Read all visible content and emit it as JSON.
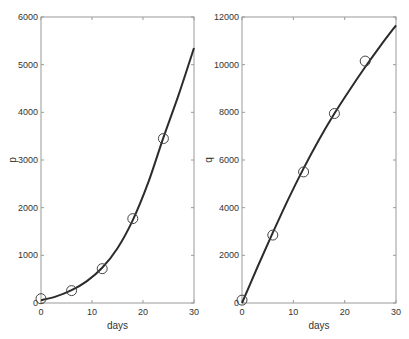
{
  "chart_data": [
    {
      "type": "line",
      "title": "",
      "xlabel": "days",
      "ylabel": "p",
      "xlim": [
        0,
        30
      ],
      "ylim": [
        0,
        6000
      ],
      "xticks": [
        0,
        10,
        20,
        30
      ],
      "yticks": [
        0,
        1000,
        2000,
        3000,
        4000,
        5000,
        6000
      ],
      "grid": false,
      "legend": null,
      "series": [
        {
          "name": "data",
          "style": "markers (open circles)",
          "x": [
            0,
            6,
            12,
            18,
            24
          ],
          "y": [
            90,
            260,
            720,
            1770,
            3450
          ]
        },
        {
          "name": "fit",
          "style": "solid line",
          "x": [
            0,
            3,
            6,
            9,
            12,
            15,
            18,
            21,
            24,
            27,
            30
          ],
          "y": [
            60,
            140,
            270,
            460,
            740,
            1150,
            1740,
            2520,
            3470,
            4370,
            5350
          ]
        }
      ]
    },
    {
      "type": "line",
      "title": "",
      "xlabel": "days",
      "ylabel": "q",
      "xlim": [
        0,
        30
      ],
      "ylim": [
        0,
        12000
      ],
      "xticks": [
        0,
        10,
        20,
        30
      ],
      "yticks": [
        0,
        2000,
        4000,
        6000,
        8000,
        10000,
        12000
      ],
      "grid": false,
      "legend": null,
      "series": [
        {
          "name": "data",
          "style": "markers (open circles)",
          "x": [
            0,
            6,
            12,
            18,
            24
          ],
          "y": [
            120,
            2850,
            5500,
            7950,
            10150
          ]
        },
        {
          "name": "fit",
          "style": "solid line",
          "x": [
            0,
            3,
            6,
            9,
            12,
            15,
            18,
            21,
            24,
            27,
            30
          ],
          "y": [
            0,
            1500,
            2950,
            4350,
            5650,
            6850,
            7950,
            8950,
            9900,
            10800,
            11650
          ]
        }
      ]
    }
  ],
  "plots": [
    {
      "ylabel": "p",
      "xlabel": "days",
      "xtick_labels": [
        "0",
        "10",
        "20",
        "30"
      ],
      "ytick_labels": [
        "0",
        "1000",
        "2000",
        "3000",
        "4000",
        "5000",
        "6000"
      ]
    },
    {
      "ylabel": "q",
      "xlabel": "days",
      "xtick_labels": [
        "0",
        "10",
        "20",
        "30"
      ],
      "ytick_labels": [
        "0",
        "2000",
        "4000",
        "6000",
        "8000",
        "10000",
        "12000"
      ]
    }
  ],
  "colors": {
    "line": "#2b2b2b",
    "axis": "#9a9a9a",
    "marker": "#444444",
    "text": "#333333"
  }
}
